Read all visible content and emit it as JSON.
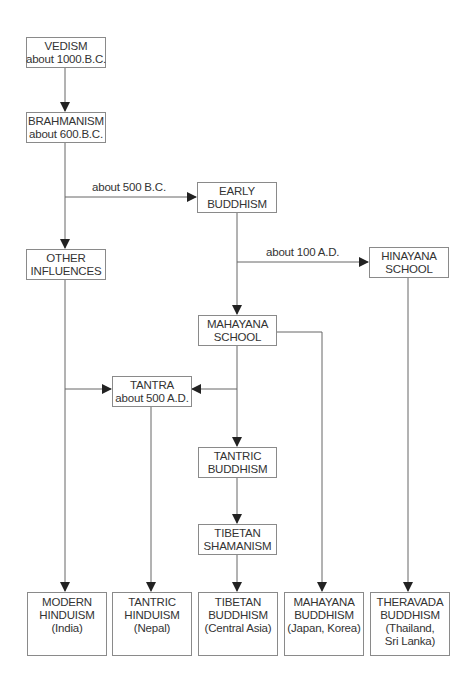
{
  "diagram": {
    "nodes": {
      "vedism": {
        "line1": "VEDISM",
        "line2": "about 1000.B.C."
      },
      "brahmanism": {
        "line1": "BRAHMANISM",
        "line2": "about 600.B.C."
      },
      "early_buddhism": {
        "line1": "EARLY",
        "line2": "BUDDHISM"
      },
      "other_influences": {
        "line1": "OTHER",
        "line2": "INFLUENCES"
      },
      "hinayana_school": {
        "line1": "HINAYANA",
        "line2": "SCHOOL"
      },
      "mahayana_school": {
        "line1": "MAHAYANA",
        "line2": "SCHOOL"
      },
      "tantra": {
        "line1": "TANTRA",
        "line2": "about 500 A.D."
      },
      "tantric_buddhism": {
        "line1": "TANTRIC",
        "line2": "BUDDHISM"
      },
      "tibetan_shamanism": {
        "line1": "TIBETAN",
        "line2": "SHAMANISM"
      },
      "modern_hinduism": {
        "line1": "MODERN",
        "line2": "HINDUISM",
        "line3": "(India)"
      },
      "tantric_hinduism": {
        "line1": "TANTRIC",
        "line2": "HINDUISM",
        "line3": "(Nepal)"
      },
      "tibetan_buddhism": {
        "line1": "TIBETAN",
        "line2": "BUDDHISM",
        "line3": "(Central Asia)"
      },
      "mahayana_buddhism": {
        "line1": "MAHAYANA",
        "line2": "BUDDHISM",
        "line3": "(Japan, Korea)"
      },
      "theravada_buddhism": {
        "line1": "THERAVADA",
        "line2": "BUDDHISM",
        "line3": "(Thailand,",
        "line4": "Sri Lanka)"
      }
    },
    "edge_labels": {
      "brahmanism_to_early_buddhism": "about 500 B.C.",
      "early_buddhism_to_hinayana": "about 100 A.D."
    },
    "edges": [
      [
        "VEDISM",
        "BRAHMANISM"
      ],
      [
        "BRAHMANISM",
        "EARLY BUDDHISM"
      ],
      [
        "BRAHMANISM",
        "OTHER INFLUENCES"
      ],
      [
        "EARLY BUDDHISM",
        "HINAYANA SCHOOL"
      ],
      [
        "EARLY BUDDHISM",
        "MAHAYANA SCHOOL"
      ],
      [
        "MAHAYANA SCHOOL",
        "TANTRA"
      ],
      [
        "OTHER INFLUENCES",
        "TANTRA"
      ],
      [
        "MAHAYANA SCHOOL",
        "TANTRIC BUDDHISM"
      ],
      [
        "MAHAYANA SCHOOL",
        "MAHAYANA BUDDHISM"
      ],
      [
        "TANTRIC BUDDHISM",
        "TIBETAN SHAMANISM"
      ],
      [
        "TIBETAN SHAMANISM",
        "TIBETAN BUDDHISM"
      ],
      [
        "OTHER INFLUENCES",
        "MODERN HINDUISM"
      ],
      [
        "TANTRA",
        "TANTRIC HINDUISM"
      ],
      [
        "HINAYANA SCHOOL",
        "THERAVADA BUDDHISM"
      ]
    ],
    "colors": {
      "line": "#555555",
      "border": "#8a8a8a",
      "text": "#333333"
    }
  }
}
